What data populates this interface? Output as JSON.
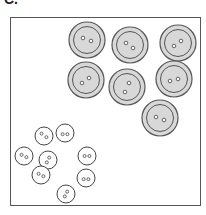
{
  "label": "C.",
  "colors": {
    "large_fill": "#d8d8d8",
    "large_stroke": "#555555",
    "small_fill": "#ffffff",
    "small_stroke": "#444444",
    "frame": "#555555"
  },
  "large_buttons": [
    {
      "cx": 87,
      "cy": 40,
      "holes": [
        [
          -4,
          -2
        ],
        [
          4,
          1
        ]
      ]
    },
    {
      "cx": 130,
      "cy": 45,
      "holes": [
        [
          -4,
          -2
        ],
        [
          3,
          3
        ]
      ]
    },
    {
      "cx": 178,
      "cy": 43,
      "holes": [
        [
          -4,
          3
        ],
        [
          3,
          -2
        ]
      ]
    },
    {
      "cx": 86,
      "cy": 80,
      "holes": [
        [
          -4,
          3
        ],
        [
          3,
          -2
        ]
      ]
    },
    {
      "cx": 127,
      "cy": 87,
      "holes": [
        [
          2,
          -4
        ],
        [
          -2,
          5
        ]
      ]
    },
    {
      "cx": 174,
      "cy": 79,
      "holes": [
        [
          -4,
          2
        ],
        [
          4,
          0
        ]
      ]
    },
    {
      "cx": 160,
      "cy": 118,
      "holes": [
        [
          -4,
          -1
        ],
        [
          4,
          2
        ]
      ]
    }
  ],
  "small_buttons": [
    {
      "cx": 44,
      "cy": 136,
      "holes": [
        [
          -2,
          -2
        ],
        [
          2,
          1
        ]
      ]
    },
    {
      "cx": 65,
      "cy": 133,
      "holes": [
        [
          -2,
          1
        ],
        [
          2,
          1
        ]
      ]
    },
    {
      "cx": 24,
      "cy": 156,
      "holes": [
        [
          -2,
          -1
        ],
        [
          2,
          1
        ]
      ]
    },
    {
      "cx": 48,
      "cy": 160,
      "holes": [
        [
          1,
          -2
        ],
        [
          -1,
          2
        ]
      ]
    },
    {
      "cx": 87,
      "cy": 156,
      "holes": [
        [
          -2,
          0
        ],
        [
          2,
          0
        ]
      ]
    },
    {
      "cx": 41,
      "cy": 175,
      "holes": [
        [
          -2,
          -1
        ],
        [
          2,
          1
        ]
      ]
    },
    {
      "cx": 86,
      "cy": 178,
      "holes": [
        [
          -2,
          1
        ],
        [
          2,
          1
        ]
      ]
    },
    {
      "cx": 66,
      "cy": 194,
      "holes": [
        [
          1,
          -2
        ],
        [
          -1,
          2
        ]
      ]
    }
  ]
}
